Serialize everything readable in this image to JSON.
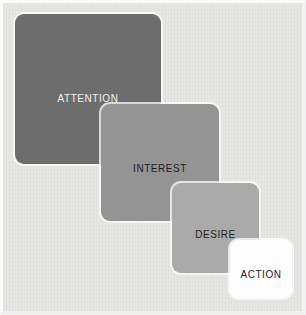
{
  "figure": {
    "name": "AIDA model funnel",
    "background_color": "#e6e6e3",
    "frame_color": "#fbfbfb",
    "stages": [
      {
        "id": "attention",
        "label": "ATTENTION",
        "fill": "#6d6d6d",
        "text_color": "#f2f2f2",
        "order": 1
      },
      {
        "id": "interest",
        "label": "INTEREST",
        "fill": "#949494",
        "text_color": "#1c1c1c",
        "order": 2
      },
      {
        "id": "desire",
        "label": "DESIRE",
        "fill": "#aaaaaa",
        "text_color": "#1c1c1c",
        "order": 3
      },
      {
        "id": "action",
        "label": "ACTION",
        "fill": "#fdfdfd",
        "text_color": "#1c1c1c",
        "order": 4
      }
    ]
  }
}
